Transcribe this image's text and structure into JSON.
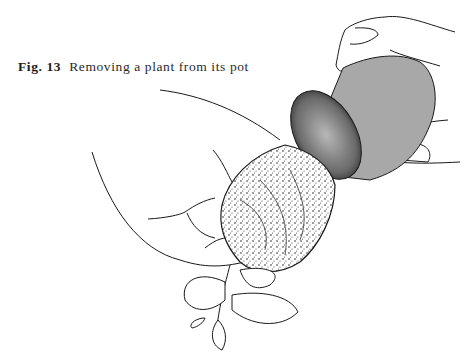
{
  "figure": {
    "label": "Fig. 13",
    "caption": "Removing a plant from its pot",
    "illustration": {
      "subject": "hands-tipping-plant-out-of-pot",
      "elements": [
        "pot",
        "root-ball",
        "left-hand",
        "right-hand",
        "plant-leaves"
      ],
      "colors": {
        "ink": "#1a1a1a",
        "pot_fill": "#a8a8a8",
        "pot_rim_dark": "#3a3a3a",
        "paper": "#ffffff"
      }
    }
  }
}
